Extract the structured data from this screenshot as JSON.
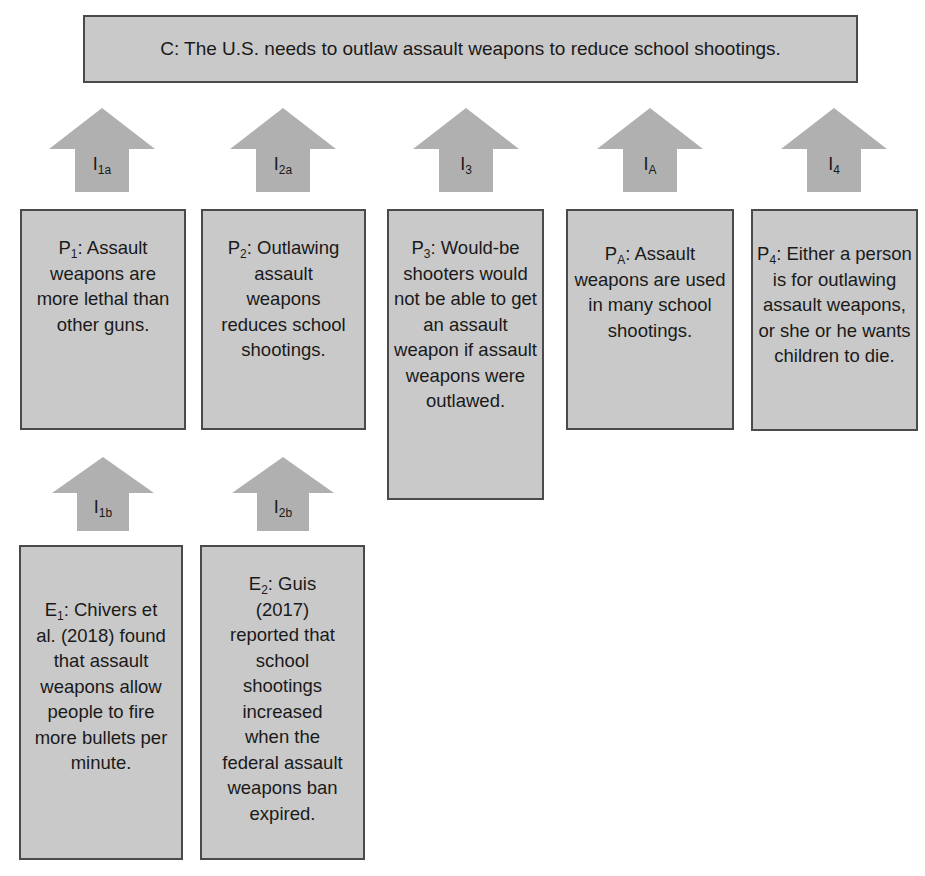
{
  "claim": {
    "id": "C",
    "text": "C: The U.S. needs to outlaw assault weapons to reduce school shootings."
  },
  "colors": {
    "box_fill": "#c9c9c9",
    "box_border": "#4a4a4a",
    "arrow_fill": "#b0b0b0",
    "text": "#1a1a1a"
  },
  "inferences": [
    {
      "base": "I",
      "sub": "1a"
    },
    {
      "base": "I",
      "sub": "2a"
    },
    {
      "base": "I",
      "sub": "3"
    },
    {
      "base": "I",
      "sub": "A"
    },
    {
      "base": "I",
      "sub": "4"
    },
    {
      "base": "I",
      "sub": "1b"
    },
    {
      "base": "I",
      "sub": "2b"
    }
  ],
  "premises": [
    {
      "base": "P",
      "sub": "1",
      "text": ": Assault weapons are more lethal than other guns."
    },
    {
      "base": "P",
      "sub": "2",
      "text": ": Outlawing assault weapons reduces school shootings."
    },
    {
      "base": "P",
      "sub": "3",
      "text": ": Would-be shooters would not be able to get an assault weapon if assault weapons were outlawed."
    },
    {
      "base": "P",
      "sub": "A",
      "text": ": Assault weapons are used in many school shootings."
    },
    {
      "base": "P",
      "sub": "4",
      "text": ": Either a person is for outlawing assault weapons, or she or he wants children to die."
    }
  ],
  "evidence": [
    {
      "base": "E",
      "sub": "1",
      "text": ": Chivers et al. (2018) found that assault weapons allow people to fire more bullets per minute."
    },
    {
      "base": "E",
      "sub": "2",
      "text": ": Guis (2017) reported that school shootings increased when the federal assault weapons ban expired."
    }
  ]
}
